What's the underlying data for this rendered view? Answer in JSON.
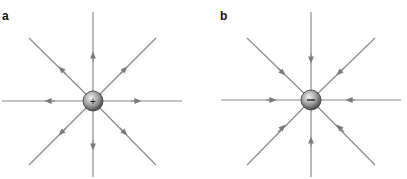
{
  "figure": {
    "panels": [
      {
        "label": "a",
        "charge_sign": "+",
        "charge": "positive",
        "field_direction": "outward"
      },
      {
        "label": "b",
        "charge_sign": "−",
        "charge": "negative",
        "field_direction": "inward"
      }
    ],
    "colors": {
      "line": "#8a8a8a",
      "arrow": "#7a7a7a",
      "charge_light": "#e8e8e8",
      "charge_dark": "#555555"
    }
  }
}
